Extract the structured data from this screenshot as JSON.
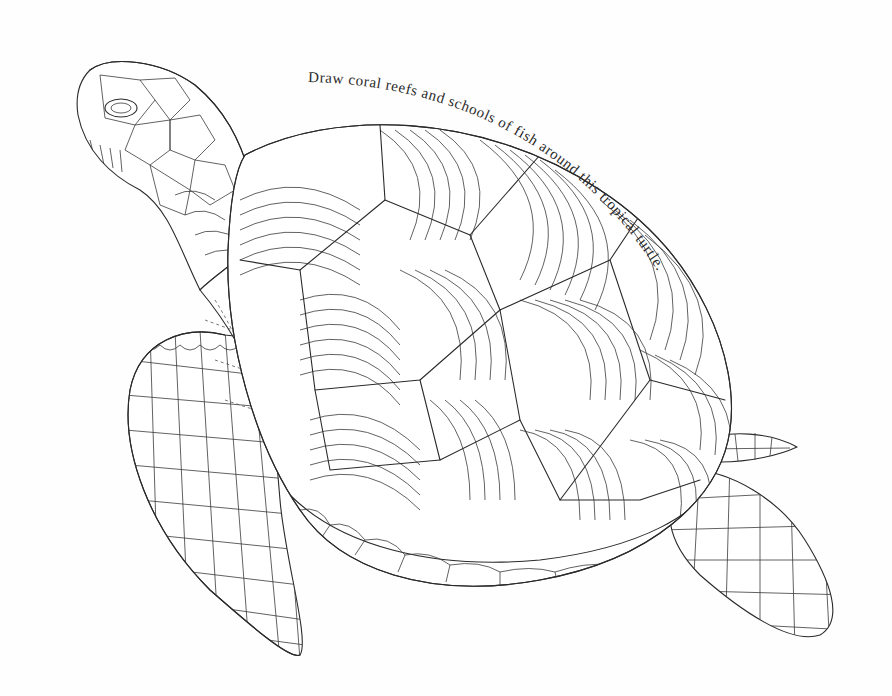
{
  "page": {
    "type": "coloring-book-page",
    "background_color": "#fefefe",
    "line_color": "#2a2a2a"
  },
  "caption": {
    "text": "Draw coral reefs and schools of fish around this tropical turtle."
  },
  "illustration": {
    "parts": [
      {
        "name": "head",
        "pattern": "scale-tiles"
      },
      {
        "name": "neck",
        "pattern": "overlapping-scales"
      },
      {
        "name": "shell",
        "pattern": "curved-line-segments"
      },
      {
        "name": "shell-rim",
        "pattern": "braided-border"
      },
      {
        "name": "front-flipper",
        "pattern": "polygon-mosaic"
      },
      {
        "name": "back-flipper",
        "pattern": "polygon-mosaic"
      },
      {
        "name": "tail",
        "pattern": "polygon-mosaic"
      },
      {
        "name": "inner-body",
        "pattern": "dashed-seams"
      }
    ]
  }
}
